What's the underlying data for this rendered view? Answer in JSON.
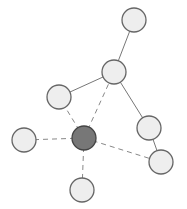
{
  "diagram": {
    "type": "network-graph",
    "colors": {
      "node_fill": "#eeeeee",
      "node_stroke": "#666666",
      "hub_fill": "#777777",
      "hub_stroke": "#444444",
      "solid_edge": "#777777",
      "dashed_edge": "#888888"
    },
    "node_radius": 12,
    "nodes": [
      {
        "id": "n_top",
        "x": 134,
        "y": 20,
        "hub": false
      },
      {
        "id": "n_mid",
        "x": 114,
        "y": 72,
        "hub": false
      },
      {
        "id": "n_upper_left",
        "x": 59,
        "y": 97,
        "hub": false
      },
      {
        "id": "n_right",
        "x": 149,
        "y": 128,
        "hub": false
      },
      {
        "id": "n_lower_right",
        "x": 161,
        "y": 162,
        "hub": false
      },
      {
        "id": "n_far_left",
        "x": 24,
        "y": 140,
        "hub": false
      },
      {
        "id": "n_bottom",
        "x": 82,
        "y": 190,
        "hub": false
      },
      {
        "id": "n_hub",
        "x": 84,
        "y": 138,
        "hub": true
      }
    ],
    "edges": [
      {
        "from": "n_top",
        "to": "n_mid",
        "style": "solid"
      },
      {
        "from": "n_mid",
        "to": "n_upper_left",
        "style": "solid"
      },
      {
        "from": "n_mid",
        "to": "n_right",
        "style": "solid"
      },
      {
        "from": "n_right",
        "to": "n_lower_right",
        "style": "solid"
      },
      {
        "from": "n_hub",
        "to": "n_mid",
        "style": "dashed"
      },
      {
        "from": "n_hub",
        "to": "n_upper_left",
        "style": "dashed"
      },
      {
        "from": "n_hub",
        "to": "n_far_left",
        "style": "dashed"
      },
      {
        "from": "n_hub",
        "to": "n_bottom",
        "style": "dashed"
      },
      {
        "from": "n_hub",
        "to": "n_lower_right",
        "style": "dashed"
      }
    ]
  }
}
